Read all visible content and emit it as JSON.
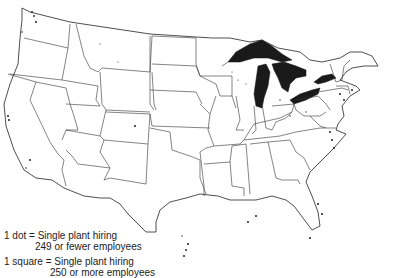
{
  "map": {
    "subject": "United States plant locations",
    "colors": {
      "background": "#ffffff",
      "boundaries": "#333333",
      "lakes": "#1a1a1a"
    }
  },
  "legend": {
    "items": [
      {
        "symbol": "dot",
        "line1": "1 dot = Single plant hiring",
        "line2": "249 or fewer employees"
      },
      {
        "symbol": "square",
        "line1": "1 square = Single plant hiring",
        "line2": "250 or more employees"
      }
    ]
  }
}
